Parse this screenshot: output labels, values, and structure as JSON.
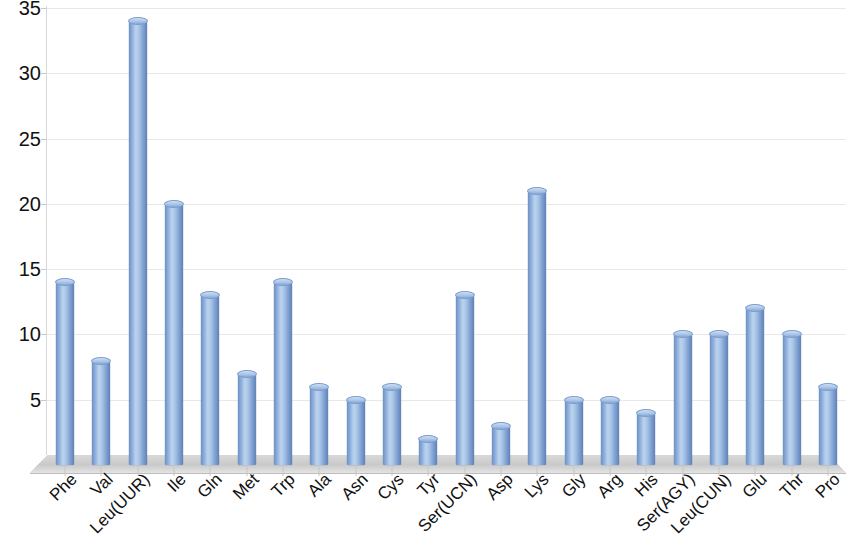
{
  "chart_data": {
    "type": "bar",
    "title": "",
    "subtitle": "",
    "xlabel": "",
    "ylabel": "",
    "ylim": [
      0,
      35
    ],
    "ytick_labels": [
      "0",
      "5",
      "10",
      "15",
      "20",
      "25",
      "30",
      "35"
    ],
    "yticks": [
      0,
      5,
      10,
      15,
      20,
      25,
      30,
      35
    ],
    "grid": true,
    "legend": false,
    "legend_position": "none",
    "style": "3d-cylinder",
    "bar_color": "#8fb0dc",
    "bar_edge_color": "#5f82b8",
    "bar_highlight_color": "#bcd3ee",
    "gridline_color": "#e8e8e8",
    "floor_color": "#cfcfcf",
    "background_color": "#ffffff",
    "text_color": "#111111",
    "categories": [
      "Phe",
      "Val",
      "Leu(UUR)",
      "Ile",
      "Gln",
      "Met",
      "Trp",
      "Ala",
      "Asn",
      "Cys",
      "Tyr",
      "Ser(UCN)",
      "Asp",
      "Lys",
      "Gly",
      "Arg",
      "His",
      "Ser(AGY)",
      "Leu(CUN)",
      "Glu",
      "Thr",
      "Pro"
    ],
    "values": [
      14,
      8,
      34,
      20,
      13,
      7,
      14,
      6,
      5,
      6,
      2,
      13,
      3,
      21,
      5,
      5,
      4,
      10,
      10,
      12,
      10,
      6
    ]
  }
}
